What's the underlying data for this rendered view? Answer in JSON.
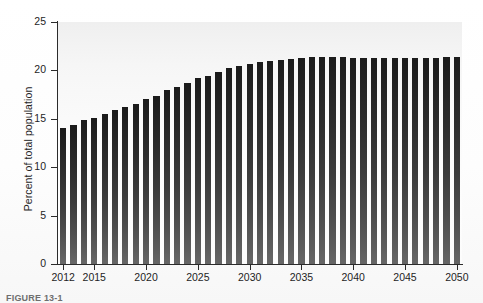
{
  "figure": {
    "caption": "FIGURE 13-1"
  },
  "chart_data": {
    "type": "bar",
    "title": "",
    "subtitle": "",
    "xlabel": "",
    "ylabel": "Percent of total population",
    "ylim": [
      0,
      25
    ],
    "yticks": [
      0,
      5,
      10,
      15,
      20,
      25
    ],
    "ytick_labels": [
      "0",
      "5",
      "10",
      "15",
      "20",
      "25"
    ],
    "xtick_labels": [
      "2012",
      "2015",
      "2020",
      "2025",
      "2030",
      "2035",
      "2040",
      "2045",
      "2050"
    ],
    "xtick_categories": [
      "2012",
      "2015",
      "2020",
      "2025",
      "2030",
      "2035",
      "2040",
      "2045",
      "2050"
    ],
    "grid": false,
    "legend": null,
    "bar_color": "#2e2e2e",
    "background_color": "#fbfbfb",
    "axis_color": "#2b2b2b",
    "categories": [
      "2012",
      "2013",
      "2014",
      "2015",
      "2016",
      "2017",
      "2018",
      "2019",
      "2020",
      "2021",
      "2022",
      "2023",
      "2024",
      "2025",
      "2026",
      "2027",
      "2028",
      "2029",
      "2030",
      "2031",
      "2032",
      "2033",
      "2034",
      "2035",
      "2036",
      "2037",
      "2038",
      "2039",
      "2040",
      "2041",
      "2042",
      "2043",
      "2044",
      "2045",
      "2046",
      "2047",
      "2048",
      "2049",
      "2050"
    ],
    "values": [
      14.1,
      14.4,
      14.9,
      15.1,
      15.5,
      15.9,
      16.2,
      16.5,
      17.0,
      17.4,
      18.0,
      18.3,
      18.7,
      19.2,
      19.4,
      19.8,
      20.2,
      20.5,
      20.7,
      20.9,
      21.0,
      21.1,
      21.2,
      21.3,
      21.4,
      21.4,
      21.4,
      21.4,
      21.3,
      21.3,
      21.3,
      21.3,
      21.3,
      21.3,
      21.3,
      21.3,
      21.3,
      21.4,
      21.4
    ]
  }
}
